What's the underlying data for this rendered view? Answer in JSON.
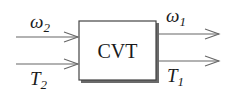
{
  "diagram": {
    "block": {
      "label": "CVT"
    },
    "inputs": [
      {
        "symbol": "ω",
        "subscript": "2",
        "kind": "angular-velocity"
      },
      {
        "symbol": "T",
        "subscript": "2",
        "kind": "torque"
      }
    ],
    "outputs": [
      {
        "symbol": "ω",
        "subscript": "1",
        "kind": "angular-velocity"
      },
      {
        "symbol": "T",
        "subscript": "1",
        "kind": "torque"
      }
    ],
    "colors": {
      "stroke": "#555555",
      "text": "#1a1a1a",
      "background": "#ffffff"
    }
  }
}
